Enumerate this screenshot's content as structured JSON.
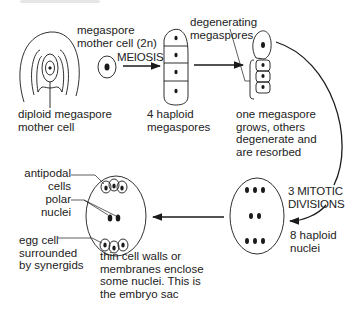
{
  "diagram": {
    "type": "embryo-sac-development",
    "stroke_color": "#1a1a1a",
    "background": "#ffffff"
  },
  "labels": {
    "megaspore_mother_cell": "megaspore\nmother cell (2n)",
    "meiosis": "MEIOSIS",
    "diploid_mother_cell": "diploid megaspore\nmother cell",
    "four_haploid": "4 haploid\nmegaspores",
    "degenerating": "degenerating\nmegaspores",
    "one_grows": "one megaspore\ngrows, others\ndegenerate and\nare resorbed",
    "mitotic": "3 MITOTIC\nDIVISIONS",
    "eight_haploid": "8 haploid\nnuclei",
    "antipodal": "antipodal\ncells",
    "polar": "polar\nnuclei",
    "egg_cell": "egg cell\nsurrounded\nby synergids",
    "thin_walls": "thin cell walls or\nmembranes enclose\nsome nuclei. This is\nthe embryo sac"
  },
  "stages": [
    {
      "id": "ovule",
      "label": "diploid megaspore mother cell"
    },
    {
      "id": "mother-cell",
      "label": "megaspore mother cell (2n)"
    },
    {
      "id": "tetrad",
      "label": "4 haploid megaspores",
      "nuclei": 4
    },
    {
      "id": "functional-megaspore",
      "label": "one megaspore grows, others degenerate and are resorbed"
    },
    {
      "id": "eight-nuclei",
      "label": "8 haploid nuclei",
      "nuclei": 8
    },
    {
      "id": "embryo-sac",
      "label": "the embryo sac"
    }
  ]
}
